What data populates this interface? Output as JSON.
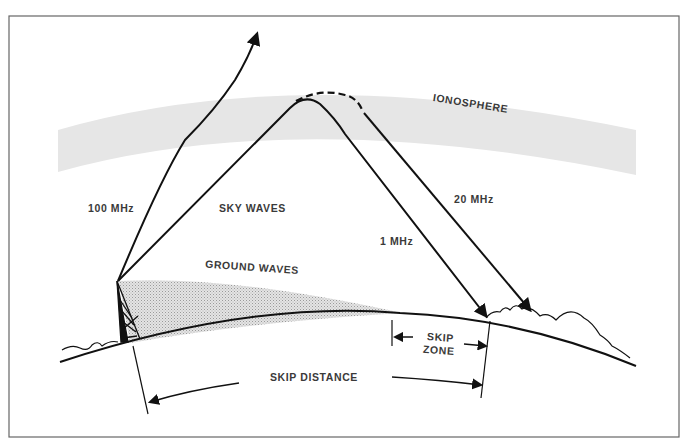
{
  "diagram": {
    "labels": {
      "ionosphere": "IONOSPHERE",
      "freq_100mhz": "100 MHz",
      "sky_waves": "SKY WAVES",
      "freq_20mhz": "20 MHz",
      "freq_1mhz": "1 MHz",
      "ground_waves": "GROUND WAVES",
      "skip_zone_line1": "SKIP",
      "skip_zone_line2": "ZONE",
      "skip_distance": "SKIP DISTANCE"
    },
    "colors": {
      "ionosphere_fill": "#e6e6e6",
      "ground_wave_fill": "#cfcfcf",
      "line": "#111111",
      "label_text": "#3a3a3a",
      "frame": "#666666"
    }
  }
}
